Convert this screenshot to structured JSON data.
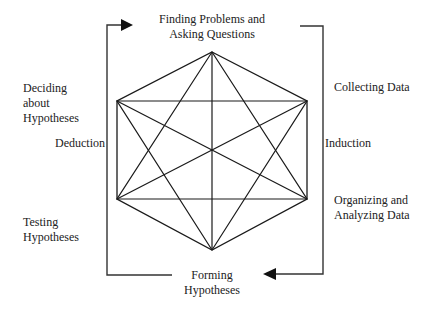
{
  "diagram": {
    "nodes": {
      "top": "Finding Problems and Asking Questions",
      "upper_right": "Collecting Data",
      "lower_right": "Organizing and Analyzing Data",
      "bottom": "Forming Hypotheses",
      "lower_left": "Testing Hypotheses",
      "upper_left": "Deciding about Hypotheses"
    },
    "labels": {
      "top_line1": "Finding Problems and",
      "top_line2": "Asking Questions",
      "upper_right": "Collecting Data",
      "induction": "Induction",
      "lower_right_line1": "Organizing and",
      "lower_right_line2": "Analyzing Data",
      "bottom_line1": "Forming",
      "bottom_line2": "Hypotheses",
      "lower_left_line1": "Testing",
      "lower_left_line2": "Hypotheses",
      "upper_left_line1": "Deciding",
      "upper_left_line2": "about",
      "upper_left_line3": "Hypotheses",
      "deduction": "Deduction"
    },
    "colors": {
      "line": "#1a1a1a",
      "bracket": "#333333",
      "background": "#ffffff"
    },
    "shape": "hexagon with all diagonals connecting every vertex",
    "flow": [
      "Forming Hypotheses -> (Deduction, left bracket upward) -> Finding Problems and Asking Questions",
      "Finding Problems and Asking Questions -> (Induction, right bracket downward) -> Forming Hypotheses"
    ]
  }
}
